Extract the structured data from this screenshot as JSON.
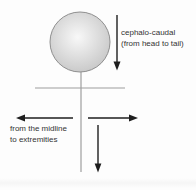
{
  "diagram": {
    "type": "growth-direction-stick-figure",
    "labels": {
      "cephalo_caudal": "cephalo-caudal\n(from head to tail)",
      "midline": "from the midline\nto extremities"
    },
    "arrows": [
      {
        "name": "cephalo-caudal-arrow",
        "direction": "down"
      },
      {
        "name": "midline-left-arrow",
        "direction": "left"
      },
      {
        "name": "midline-right-arrow",
        "direction": "right"
      },
      {
        "name": "lower-body-arrow",
        "direction": "down"
      }
    ],
    "colors": {
      "arrow": "#1e1e1e",
      "figure_line": "#9e9e9e",
      "head_fill_center": "#f8f8f8",
      "head_fill_edge": "#c7c7c7",
      "head_outline": "#8f8f8f",
      "text": "#333333"
    }
  }
}
